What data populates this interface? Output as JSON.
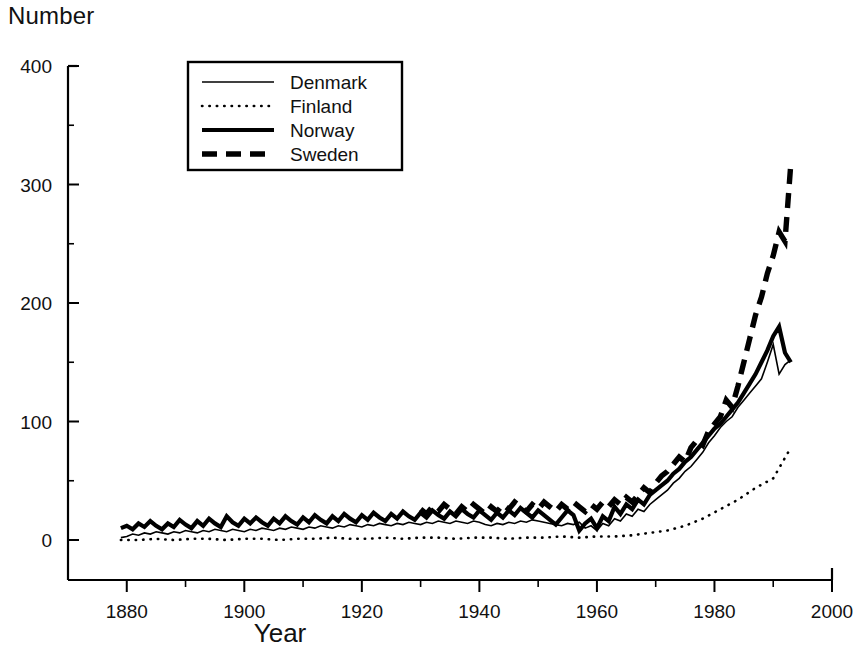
{
  "chart_data": {
    "type": "line",
    "title": "",
    "ylabel": "Number",
    "xlabel": "Year",
    "xlim": [
      1870,
      2000
    ],
    "ylim": [
      0,
      400
    ],
    "grid": false,
    "legend_position": "top-left-inside",
    "xticks": [
      1880,
      1900,
      1920,
      1940,
      1960,
      1980,
      2000
    ],
    "xtick_labels": [
      "1880",
      "1900",
      "1920",
      "1940",
      "1960",
      "1980",
      "2000"
    ],
    "xminor_step": 10,
    "yticks": [
      0,
      100,
      200,
      300,
      400
    ],
    "ytick_labels": [
      "0",
      "100",
      "200",
      "300",
      "400"
    ],
    "yminor_step": 50,
    "series": [
      {
        "name": "Denmark",
        "style": "thin-solid",
        "x": [
          1879,
          1880,
          1881,
          1882,
          1883,
          1884,
          1885,
          1886,
          1887,
          1888,
          1889,
          1890,
          1891,
          1892,
          1893,
          1894,
          1895,
          1896,
          1897,
          1898,
          1899,
          1900,
          1901,
          1902,
          1903,
          1904,
          1905,
          1906,
          1907,
          1908,
          1909,
          1910,
          1911,
          1912,
          1913,
          1914,
          1915,
          1916,
          1917,
          1918,
          1919,
          1920,
          1921,
          1922,
          1923,
          1924,
          1925,
          1926,
          1927,
          1928,
          1929,
          1930,
          1931,
          1932,
          1933,
          1934,
          1935,
          1936,
          1937,
          1938,
          1939,
          1940,
          1941,
          1942,
          1943,
          1944,
          1945,
          1946,
          1947,
          1948,
          1949,
          1950,
          1951,
          1952,
          1953,
          1954,
          1955,
          1956,
          1957,
          1958,
          1959,
          1960,
          1961,
          1962,
          1963,
          1964,
          1965,
          1966,
          1967,
          1968,
          1969,
          1970,
          1971,
          1972,
          1973,
          1974,
          1975,
          1976,
          1977,
          1978,
          1979,
          1980,
          1981,
          1982,
          1983,
          1984,
          1985,
          1986,
          1987,
          1988,
          1989,
          1990,
          1991,
          1992,
          1993
        ],
        "y": [
          2,
          3,
          5,
          4,
          6,
          5,
          7,
          6,
          5,
          7,
          6,
          8,
          7,
          6,
          8,
          7,
          9,
          8,
          7,
          9,
          8,
          7,
          9,
          8,
          10,
          9,
          8,
          10,
          9,
          11,
          10,
          9,
          11,
          10,
          12,
          11,
          10,
          12,
          11,
          13,
          12,
          11,
          13,
          12,
          14,
          13,
          12,
          14,
          13,
          15,
          14,
          13,
          15,
          14,
          16,
          15,
          14,
          16,
          15,
          14,
          16,
          15,
          13,
          12,
          14,
          13,
          15,
          14,
          16,
          15,
          17,
          16,
          15,
          14,
          13,
          12,
          14,
          13,
          15,
          10,
          12,
          8,
          14,
          12,
          18,
          16,
          22,
          20,
          26,
          24,
          30,
          34,
          38,
          42,
          48,
          52,
          58,
          62,
          68,
          74,
          82,
          88,
          95,
          100,
          104,
          112,
          118,
          124,
          130,
          136,
          150,
          165,
          140,
          148,
          152
        ]
      },
      {
        "name": "Finland",
        "style": "dotted",
        "x": [
          1879,
          1882,
          1885,
          1888,
          1891,
          1894,
          1897,
          1900,
          1903,
          1906,
          1909,
          1912,
          1915,
          1918,
          1921,
          1924,
          1927,
          1930,
          1933,
          1936,
          1939,
          1942,
          1945,
          1948,
          1951,
          1954,
          1957,
          1960,
          1963,
          1966,
          1969,
          1972,
          1975,
          1978,
          1981,
          1984,
          1987,
          1990,
          1993
        ],
        "y": [
          0,
          0,
          1,
          0,
          1,
          1,
          0,
          1,
          1,
          0,
          1,
          1,
          2,
          1,
          1,
          2,
          1,
          2,
          2,
          1,
          2,
          2,
          1,
          2,
          2,
          3,
          2,
          3,
          3,
          4,
          6,
          8,
          12,
          18,
          26,
          34,
          44,
          52,
          78
        ]
      },
      {
        "name": "Norway",
        "style": "thick-solid",
        "x": [
          1879,
          1880,
          1881,
          1882,
          1883,
          1884,
          1885,
          1886,
          1887,
          1888,
          1889,
          1890,
          1891,
          1892,
          1893,
          1894,
          1895,
          1896,
          1897,
          1898,
          1899,
          1900,
          1901,
          1902,
          1903,
          1904,
          1905,
          1906,
          1907,
          1908,
          1909,
          1910,
          1911,
          1912,
          1913,
          1914,
          1915,
          1916,
          1917,
          1918,
          1919,
          1920,
          1921,
          1922,
          1923,
          1924,
          1925,
          1926,
          1927,
          1928,
          1929,
          1930,
          1931,
          1932,
          1933,
          1934,
          1935,
          1936,
          1937,
          1938,
          1939,
          1940,
          1941,
          1942,
          1943,
          1944,
          1945,
          1946,
          1947,
          1948,
          1949,
          1950,
          1951,
          1952,
          1953,
          1954,
          1955,
          1956,
          1957,
          1958,
          1959,
          1960,
          1961,
          1962,
          1963,
          1964,
          1965,
          1966,
          1967,
          1968,
          1969,
          1970,
          1971,
          1972,
          1973,
          1974,
          1975,
          1976,
          1977,
          1978,
          1979,
          1980,
          1981,
          1982,
          1983,
          1984,
          1985,
          1986,
          1987,
          1988,
          1989,
          1990,
          1991,
          1992,
          1993
        ],
        "y": [
          10,
          12,
          9,
          14,
          11,
          16,
          12,
          9,
          14,
          11,
          17,
          13,
          10,
          16,
          12,
          18,
          14,
          11,
          20,
          15,
          12,
          18,
          14,
          19,
          15,
          12,
          18,
          14,
          20,
          16,
          13,
          19,
          15,
          21,
          17,
          14,
          20,
          16,
          22,
          18,
          15,
          21,
          17,
          23,
          19,
          16,
          22,
          18,
          24,
          20,
          17,
          23,
          19,
          25,
          21,
          18,
          24,
          20,
          26,
          22,
          19,
          25,
          21,
          17,
          23,
          19,
          25,
          21,
          27,
          23,
          19,
          25,
          21,
          17,
          13,
          19,
          25,
          21,
          8,
          14,
          18,
          10,
          20,
          16,
          28,
          22,
          30,
          26,
          34,
          30,
          38,
          42,
          46,
          50,
          56,
          60,
          66,
          70,
          76,
          82,
          88,
          94,
          98,
          104,
          110,
          116,
          124,
          132,
          140,
          150,
          160,
          172,
          180,
          158,
          150
        ]
      },
      {
        "name": "Sweden",
        "style": "thick-dashed",
        "x": [
          1930,
          1931,
          1932,
          1933,
          1934,
          1935,
          1936,
          1937,
          1938,
          1939,
          1940,
          1941,
          1942,
          1943,
          1944,
          1945,
          1946,
          1947,
          1948,
          1949,
          1950,
          1951,
          1952,
          1953,
          1954,
          1955,
          1956,
          1957,
          1958,
          1959,
          1960,
          1961,
          1962,
          1963,
          1964,
          1965,
          1966,
          1967,
          1968,
          1969,
          1970,
          1971,
          1972,
          1973,
          1974,
          1975,
          1976,
          1977,
          1978,
          1979,
          1980,
          1981,
          1982,
          1983,
          1984,
          1985,
          1986,
          1987,
          1988,
          1989,
          1990,
          1991,
          1992,
          1993
        ],
        "y": [
          26,
          22,
          28,
          24,
          30,
          26,
          22,
          28,
          24,
          30,
          26,
          22,
          28,
          24,
          30,
          26,
          32,
          28,
          24,
          30,
          26,
          32,
          28,
          24,
          30,
          26,
          32,
          28,
          24,
          30,
          26,
          32,
          28,
          34,
          30,
          36,
          32,
          38,
          44,
          40,
          48,
          54,
          58,
          64,
          70,
          66,
          78,
          84,
          80,
          92,
          98,
          104,
          118,
          112,
          130,
          150,
          170,
          190,
          205,
          225,
          240,
          260,
          252,
          318
        ]
      }
    ]
  },
  "legend": {
    "entries": [
      {
        "label": "Denmark",
        "style": "thin-solid"
      },
      {
        "label": "Finland",
        "style": "dotted"
      },
      {
        "label": "Norway",
        "style": "thick-solid"
      },
      {
        "label": "Sweden",
        "style": "thick-dashed"
      }
    ]
  },
  "axis_labels": {
    "y_top": "Number",
    "x_bottom": "Year"
  },
  "colors": {
    "line": "#000000",
    "axis": "#000000",
    "background": "#ffffff"
  }
}
